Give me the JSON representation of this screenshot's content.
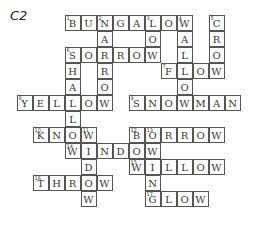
{
  "label": "C2",
  "grid": {
    "origin_x": 17,
    "origin_y": 15,
    "cell": 16
  },
  "cells": [
    {
      "r": 0,
      "c": 3,
      "ch": "B",
      "n": "1"
    },
    {
      "r": 0,
      "c": 4,
      "ch": "U"
    },
    {
      "r": 0,
      "c": 5,
      "ch": "N",
      "n": "2"
    },
    {
      "r": 0,
      "c": 6,
      "ch": "G"
    },
    {
      "r": 0,
      "c": 7,
      "ch": "A"
    },
    {
      "r": 0,
      "c": 8,
      "ch": "L",
      "n": "3"
    },
    {
      "r": 0,
      "c": 9,
      "ch": "O"
    },
    {
      "r": 0,
      "c": 10,
      "ch": "W",
      "n": "4"
    },
    {
      "r": 0,
      "c": 12,
      "ch": "C",
      "n": "5"
    },
    {
      "r": 1,
      "c": 5,
      "ch": "A"
    },
    {
      "r": 1,
      "c": 8,
      "ch": "O"
    },
    {
      "r": 1,
      "c": 10,
      "ch": "A"
    },
    {
      "r": 1,
      "c": 12,
      "ch": "R"
    },
    {
      "r": 2,
      "c": 3,
      "ch": "S",
      "n": "6"
    },
    {
      "r": 2,
      "c": 4,
      "ch": "O"
    },
    {
      "r": 2,
      "c": 5,
      "ch": "R"
    },
    {
      "r": 2,
      "c": 6,
      "ch": "R"
    },
    {
      "r": 2,
      "c": 7,
      "ch": "O"
    },
    {
      "r": 2,
      "c": 8,
      "ch": "W"
    },
    {
      "r": 2,
      "c": 10,
      "ch": "L"
    },
    {
      "r": 2,
      "c": 12,
      "ch": "O"
    },
    {
      "r": 3,
      "c": 3,
      "ch": "H"
    },
    {
      "r": 3,
      "c": 5,
      "ch": "R"
    },
    {
      "r": 3,
      "c": 9,
      "ch": "F",
      "n": "7"
    },
    {
      "r": 3,
      "c": 10,
      "ch": "L"
    },
    {
      "r": 3,
      "c": 11,
      "ch": "O"
    },
    {
      "r": 3,
      "c": 12,
      "ch": "W"
    },
    {
      "r": 4,
      "c": 3,
      "ch": "A"
    },
    {
      "r": 4,
      "c": 5,
      "ch": "O"
    },
    {
      "r": 4,
      "c": 10,
      "ch": "O"
    },
    {
      "r": 5,
      "c": 0,
      "ch": "Y",
      "n": "8"
    },
    {
      "r": 5,
      "c": 1,
      "ch": "E"
    },
    {
      "r": 5,
      "c": 2,
      "ch": "L"
    },
    {
      "r": 5,
      "c": 3,
      "ch": "L"
    },
    {
      "r": 5,
      "c": 4,
      "ch": "O"
    },
    {
      "r": 5,
      "c": 5,
      "ch": "W"
    },
    {
      "r": 5,
      "c": 7,
      "ch": "S",
      "n": "9"
    },
    {
      "r": 5,
      "c": 8,
      "ch": "N"
    },
    {
      "r": 5,
      "c": 9,
      "ch": "O"
    },
    {
      "r": 5,
      "c": 10,
      "ch": "W"
    },
    {
      "r": 5,
      "c": 11,
      "ch": "M"
    },
    {
      "r": 5,
      "c": 12,
      "ch": "A"
    },
    {
      "r": 5,
      "c": 13,
      "ch": "N"
    },
    {
      "r": 6,
      "c": 3,
      "ch": "L"
    },
    {
      "r": 7,
      "c": 1,
      "ch": "K",
      "n": "10"
    },
    {
      "r": 7,
      "c": 2,
      "ch": "N"
    },
    {
      "r": 7,
      "c": 3,
      "ch": "O"
    },
    {
      "r": 7,
      "c": 4,
      "ch": "W",
      "n": "11"
    },
    {
      "r": 7,
      "c": 7,
      "ch": "B",
      "n": "12"
    },
    {
      "r": 7,
      "c": 8,
      "ch": "O",
      "n": "13"
    },
    {
      "r": 7,
      "c": 9,
      "ch": "R"
    },
    {
      "r": 7,
      "c": 10,
      "ch": "R"
    },
    {
      "r": 7,
      "c": 11,
      "ch": "O"
    },
    {
      "r": 7,
      "c": 12,
      "ch": "W"
    },
    {
      "r": 8,
      "c": 3,
      "ch": "W",
      "n": "14"
    },
    {
      "r": 8,
      "c": 4,
      "ch": "I"
    },
    {
      "r": 8,
      "c": 5,
      "ch": "N"
    },
    {
      "r": 8,
      "c": 6,
      "ch": "D"
    },
    {
      "r": 8,
      "c": 7,
      "ch": "O"
    },
    {
      "r": 8,
      "c": 8,
      "ch": "W"
    },
    {
      "r": 9,
      "c": 4,
      "ch": "D"
    },
    {
      "r": 9,
      "c": 7,
      "ch": "W",
      "n": "15"
    },
    {
      "r": 9,
      "c": 8,
      "ch": "I"
    },
    {
      "r": 9,
      "c": 9,
      "ch": "L"
    },
    {
      "r": 9,
      "c": 10,
      "ch": "L"
    },
    {
      "r": 9,
      "c": 11,
      "ch": "O"
    },
    {
      "r": 9,
      "c": 12,
      "ch": "W"
    },
    {
      "r": 10,
      "c": 1,
      "ch": "T",
      "n": "16"
    },
    {
      "r": 10,
      "c": 2,
      "ch": "H"
    },
    {
      "r": 10,
      "c": 3,
      "ch": "R"
    },
    {
      "r": 10,
      "c": 4,
      "ch": "O"
    },
    {
      "r": 10,
      "c": 5,
      "ch": "W"
    },
    {
      "r": 10,
      "c": 8,
      "ch": "N"
    },
    {
      "r": 11,
      "c": 4,
      "ch": "W"
    },
    {
      "r": 11,
      "c": 8,
      "ch": "G",
      "n": "17"
    },
    {
      "r": 11,
      "c": 9,
      "ch": "L"
    },
    {
      "r": 11,
      "c": 10,
      "ch": "O"
    },
    {
      "r": 11,
      "c": 11,
      "ch": "W"
    }
  ]
}
